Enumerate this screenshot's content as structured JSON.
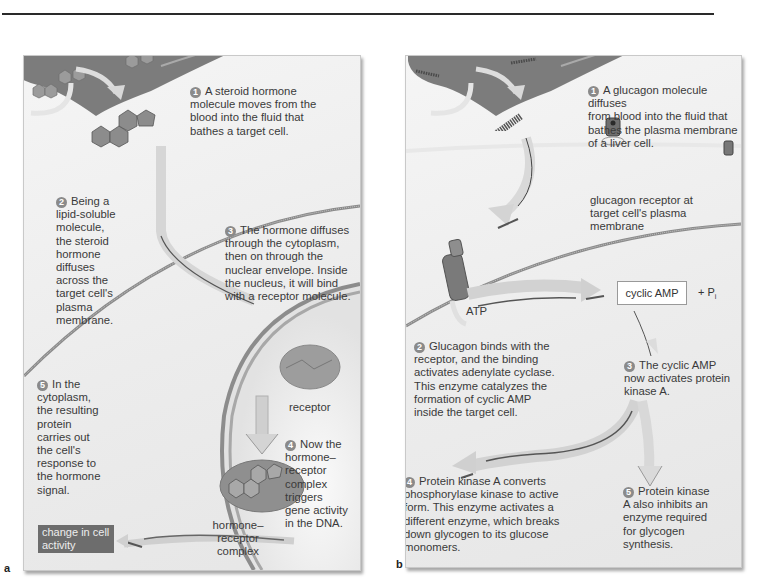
{
  "figure": {
    "panels": [
      {
        "letter": "a",
        "title": "Steroid hormone action",
        "steps": [
          {
            "num": "1",
            "text": "A steroid hormone\nmolecule moves from the\nblood into the fluid that\nbathes a target cell."
          },
          {
            "num": "2",
            "text": "Being a\nlipid-soluble\nmolecule,\nthe steroid\nhormone\ndiffuses\nacross the\ntarget cell's\nplasma\nmembrane."
          },
          {
            "num": "3",
            "text": "The hormone diffuses\nthrough the cytoplasm,\nthen on through the\nnuclear envelope. Inside\nthe nucleus, it will bind\nwith a receptor molecule."
          },
          {
            "num": "4",
            "text": "Now the\nhormone–\nreceptor\ncomplex\ntriggers\ngene activity\nin the DNA."
          },
          {
            "num": "5",
            "text": "In the\ncytoplasm,\nthe resulting\nprotein\ncarries out\nthe cell's\nresponse to\nthe hormone\nsignal."
          }
        ],
        "labels": {
          "receptor": "receptor",
          "complex": "hormone–\nreceptor\ncomplex",
          "change": "change in\ncell activity"
        }
      },
      {
        "letter": "b",
        "title": "Peptide hormone (glucagon) action",
        "steps": [
          {
            "num": "1",
            "text": "A glucagon molecule diffuses\nfrom blood into the fluid that\nbathes the plasma membrane\nof a liver cell."
          },
          {
            "num": "2",
            "text": "Glucagon binds with the\nreceptor, and the binding\nactivates adenylate cyclase.\nThis enzyme catalyzes the\nformation of cyclic AMP\ninside the target cell."
          },
          {
            "num": "3",
            "text": "The cyclic AMP\nnow activates protein\nkinase A."
          },
          {
            "num": "4",
            "text": "Protein kinase A converts\nphosphorylase kinase to active\nform. This enzyme activates a\ndifferent enzyme, which breaks\ndown glycogen to its glucose\nmonomers."
          },
          {
            "num": "5",
            "text": "Protein kinase\nA also inhibits an\nenzyme required\nfor glycogen\nsynthesis."
          }
        ],
        "labels": {
          "receptor": "glucagon receptor at\ntarget cell's plasma\nmembrane",
          "atp": "ATP",
          "camp": "cyclic AMP",
          "pi_prefix": "+ P",
          "pi_sub": "i"
        }
      }
    ]
  }
}
